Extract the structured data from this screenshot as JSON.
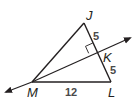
{
  "diagram": {
    "type": "geometry-triangle-with-perpendicular-bisector",
    "points": {
      "J": {
        "label": "J",
        "x": 84,
        "y": 23
      },
      "K": {
        "label": "K",
        "x": 97,
        "y": 52
      },
      "L": {
        "label": "L",
        "x": 111,
        "y": 82
      },
      "M": {
        "label": "M",
        "x": 32,
        "y": 82
      }
    },
    "measures": {
      "JK": "5",
      "KL": "5",
      "ML": "12"
    },
    "line_color": "#231f20",
    "right_angle_at": "K"
  }
}
